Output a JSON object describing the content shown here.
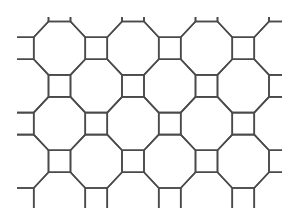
{
  "diagram": {
    "title": "",
    "type": "truncated square tiling",
    "tiles": {
      "octagon": {
        "sides": 8,
        "count_visible_full": 7
      },
      "square": {
        "sides": 4,
        "count_visible_full": 16
      }
    },
    "grid": {
      "columns": 8,
      "rows": 6,
      "pattern": "octagon where (col+row) is even, square where odd"
    },
    "line_color": "#4a4a4a",
    "background_color": "#ffffff"
  }
}
